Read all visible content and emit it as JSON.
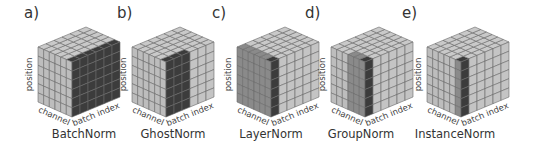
{
  "figure": {
    "grid_size": 6,
    "colors": {
      "light_top": "#c9c9c9",
      "light_left": "#bdbdbd",
      "light_right": "#c4c4c4",
      "mid": "#8a8a8a",
      "dark": "#3c3c3c",
      "darkest": "#2a2a2a",
      "grid_line": "#6a6a6a"
    },
    "axis_labels": {
      "vertical": "position",
      "left_depth": "channel",
      "right_depth": "batch index"
    },
    "panels": [
      {
        "label": "a)",
        "caption": "BatchNorm",
        "x": 38,
        "label_x": 24,
        "caption_x": 84,
        "highlight": {
          "left_cols": [],
          "left_color": "mid",
          "right_cols": [
            0,
            1,
            2,
            3,
            4,
            5
          ],
          "right_color": "dark",
          "top_front_row_left": false,
          "top_front_row_right": true
        }
      },
      {
        "label": "b)",
        "caption": "GhostNorm",
        "x": 132,
        "label_x": 117,
        "caption_x": 173,
        "highlight": {
          "left_cols": [],
          "left_color": "mid",
          "right_cols": [
            0,
            1,
            2
          ],
          "right_color": "dark",
          "top_front_row_left": false,
          "top_front_row_right": true
        }
      },
      {
        "label": "c)",
        "caption": "LayerNorm",
        "x": 237,
        "label_x": 212,
        "caption_x": 271,
        "highlight": {
          "left_cols": [
            0,
            1,
            2,
            3,
            4,
            5
          ],
          "left_color": "mid",
          "right_cols": [
            0
          ],
          "right_color": "dark",
          "top_front_row_left": true,
          "top_front_row_right": false
        }
      },
      {
        "label": "d)",
        "caption": "GroupNorm",
        "x": 331,
        "label_x": 305,
        "caption_x": 361,
        "highlight": {
          "left_cols": [
            3,
            4,
            5
          ],
          "left_color": "mid",
          "right_cols": [
            0
          ],
          "right_color": "dark",
          "top_front_row_left": true,
          "top_front_row_right": false
        }
      },
      {
        "label": "e)",
        "caption": "InstanceNorm",
        "x": 427,
        "label_x": 402,
        "caption_x": 455,
        "highlight": {
          "left_cols": [
            5
          ],
          "left_color": "mid",
          "right_cols": [
            0
          ],
          "right_color": "dark",
          "top_front_row_left": true,
          "top_front_row_right": false
        }
      }
    ]
  }
}
